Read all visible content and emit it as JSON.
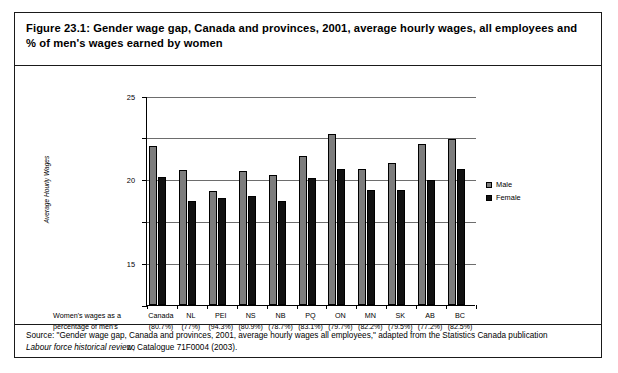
{
  "figure": {
    "title": "Figure 23.1: Gender wage gap, Canada and provinces, 2001, average hourly wages, all employees and % of men's wages earned by women",
    "source_line1": "Source: \"Gender wage gap, Canada and provinces, 2001, average hourly wages all employees,\" adapted from the Statistics Canada publication",
    "source_line2_italic": "Labour force historical review",
    "source_line2_rest": ", Catalogue 71F0004 (2003)."
  },
  "axis_caption": "Women's wages as a percentage of men's",
  "legend": {
    "male_label": "Male",
    "female_label": "Female",
    "male_color": "#7d7d7d",
    "female_color": "#111111"
  },
  "chart_data": {
    "type": "bar",
    "title": "Gender wage gap, Canada and provinces, 2001, average hourly wages, all employees and % of men's wages earned by women",
    "xlabel": "Women's wages as a percentage of men's",
    "ylabel": "Average Hourly Wages",
    "ylim": [
      0,
      25
    ],
    "yticks": [
      0,
      5,
      10,
      15,
      20,
      25
    ],
    "ytick_labels": [
      "0",
      "5",
      "10",
      "15",
      "20",
      "25"
    ],
    "grid": true,
    "legend_position": "right",
    "categories": [
      "Canada",
      "NL",
      "PEI",
      "NS",
      "NB",
      "PQ",
      "ON",
      "MN",
      "SK",
      "AB",
      "BC"
    ],
    "category_percentages": [
      "(80.7%)",
      "(77%)",
      "(94.3%)",
      "(80.9%)",
      "(78.7%)",
      "(83.1%)",
      "(79.7%)",
      "(82.2%)",
      "(79.5%)",
      "(77.2%)",
      "(82.5%)"
    ],
    "series": [
      {
        "name": "Male",
        "color": "#7d7d7d",
        "values": [
          19.0,
          16.2,
          13.6,
          16.0,
          15.6,
          17.8,
          20.5,
          16.3,
          17.0,
          19.3,
          19.8
        ]
      },
      {
        "name": "Female",
        "color": "#111111",
        "values": [
          15.3,
          12.4,
          12.8,
          13.0,
          12.5,
          15.2,
          16.3,
          13.8,
          13.8,
          15.0,
          16.3
        ]
      }
    ]
  }
}
